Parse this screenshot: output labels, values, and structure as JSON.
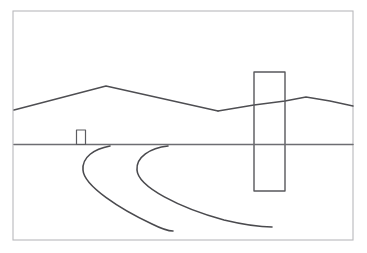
{
  "artwork": {
    "title": "Pencil Landscape Sketch",
    "medium": "graphite pencil line drawing",
    "subject": "minimal desert landscape with curving road, distant hut, monolithic slab and mountain ridge",
    "canvas": {
      "width": 367,
      "height": 253
    },
    "background_color": "#ffffff"
  },
  "palette": {
    "paper": "#ffffff",
    "frame_line": "#b9b9bc",
    "ridge_line": "#4e4e52",
    "horizon_line": "#6d6d72",
    "road_line": "#4a4a4e",
    "slab_line": "#58585c",
    "hut_line": "#5c5c60"
  },
  "frame": {
    "name": "drawing-border",
    "x": 13,
    "y": 11,
    "width": 340,
    "height": 229,
    "stroke_width": 1.1,
    "color": "#b9b9bc"
  },
  "horizon": {
    "name": "horizon-line",
    "y": 144.5,
    "x_start": 14,
    "x_end": 353,
    "stroke_width": 1.5,
    "color": "#6d6d72"
  },
  "mountain_ridge": {
    "name": "mountain-ridge",
    "stroke_width": 1.4,
    "color": "#4e4e52",
    "left_massif": {
      "label": "large left mountain",
      "points": "14,110 106,86 218,111"
    },
    "right_massif": {
      "label": "smaller right mountain",
      "points": "218,111 254,105 285,101 306,97 330,101 353,106"
    },
    "peaks": [
      {
        "label": "main peak",
        "x": 106,
        "y": 86
      },
      {
        "label": "saddle notch",
        "x": 218,
        "y": 111
      },
      {
        "label": "right peak",
        "x": 306,
        "y": 97
      }
    ]
  },
  "slab": {
    "name": "monolith-slab",
    "label": "tall vertical rectangle",
    "x": 254,
    "y": 72,
    "width": 31,
    "height": 119,
    "stroke_width": 1.4,
    "color": "#58585c",
    "fill": "#ffffff"
  },
  "hut": {
    "name": "distant-hut",
    "label": "small rectangular structure at horizon",
    "x": 76.5,
    "y": 130,
    "width": 9,
    "height": 14.5,
    "stroke_width": 1.2,
    "color": "#5c5c60",
    "fill": "#ffffff"
  },
  "road": {
    "name": "curving-road",
    "stroke_width": 1.6,
    "color": "#4a4a4e",
    "description": "two sweeping curves receding from the foreground toward the horizon",
    "left_edge": {
      "name": "road-left-edge",
      "path": "M 110 146 C 94 149, 82 157, 83 170 C 84 186, 120 209, 152 224 C 160 228, 168 231, 173 231"
    },
    "right_edge": {
      "name": "road-right-edge",
      "path": "M 168 146 C 150 148, 136 157, 137 170 C 138 187, 180 208, 224 220 C 245 225, 262 227, 272 227"
    }
  },
  "elements_index": [
    {
      "name": "drawing-border",
      "label": "Drawing border"
    },
    {
      "name": "mountain-ridge",
      "label": "Mountain ridge"
    },
    {
      "name": "horizon-line",
      "label": "Horizon line"
    },
    {
      "name": "monolith-slab",
      "label": "Monolith slab"
    },
    {
      "name": "distant-hut",
      "label": "Distant hut"
    },
    {
      "name": "curving-road",
      "label": "Curving road"
    }
  ]
}
